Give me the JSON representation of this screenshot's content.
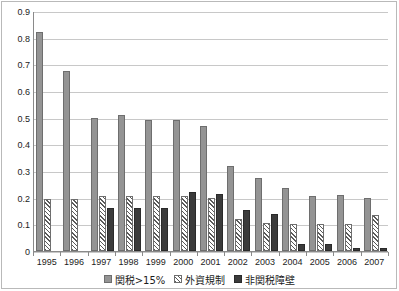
{
  "chart_data": {
    "type": "bar",
    "title": "",
    "xlabel": "",
    "ylabel": "",
    "ylim": [
      0,
      0.9
    ],
    "yticks": [
      "0",
      "0.1",
      "0.2",
      "0.3",
      "0.4",
      "0.5",
      "0.6",
      "0.7",
      "0.8",
      "0.9"
    ],
    "grid": true,
    "legend_position": "bottom",
    "categories": [
      "1995",
      "1996",
      "1997",
      "1998",
      "1999",
      "2000",
      "2001",
      "2002",
      "2003",
      "2004",
      "2005",
      "2006",
      "2007"
    ],
    "series": [
      {
        "name": "関税>15%",
        "color": "#949494",
        "pattern": "solid",
        "values": [
          0.82,
          0.675,
          0.5,
          0.51,
          0.49,
          0.49,
          0.47,
          0.32,
          0.275,
          0.235,
          0.205,
          0.21,
          0.2
        ]
      },
      {
        "name": "外資規制",
        "color": "#ffffff",
        "pattern": "diagonal-hatch",
        "values": [
          0.195,
          0.195,
          0.205,
          0.205,
          0.205,
          0.205,
          0.2,
          0.12,
          0.105,
          0.1,
          0.1,
          0.1,
          0.135
        ]
      },
      {
        "name": "非関税障壁",
        "color": "#3b3b3b",
        "pattern": "solid",
        "values": [
          0.0,
          0.0,
          0.16,
          0.16,
          0.16,
          0.22,
          0.215,
          0.155,
          0.14,
          0.025,
          0.025,
          0.012,
          0.012
        ]
      }
    ]
  },
  "legend": {
    "entries": [
      {
        "label": "関税>15%"
      },
      {
        "label": "外資規制"
      },
      {
        "label": "非関税障壁"
      }
    ]
  }
}
